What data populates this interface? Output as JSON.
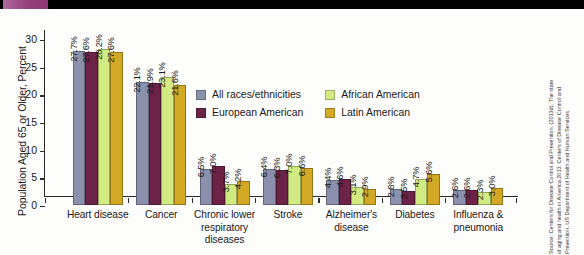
{
  "figure": {
    "y_axis_title": "Population Aged 65 or Older, Percent",
    "source_lines": [
      "Source: Centers for Disease Control and Prevention. (2013d). The state",
      "of aging and health in America 2013. Centers of Disease Control and",
      "Prevention, US Department of Health and Human Services."
    ]
  },
  "chart_data": {
    "type": "bar",
    "title": "",
    "xlabel": "",
    "ylabel": "Population Aged 65 or Older, Percent",
    "ylim": [
      0,
      30
    ],
    "yticks": [
      0,
      5,
      10,
      15,
      20,
      25,
      30
    ],
    "ytick_labels": [
      "0",
      "5",
      "10",
      "15",
      "20",
      "25",
      "30"
    ],
    "grid": false,
    "legend_position": "center",
    "value_suffix": "%",
    "categories": [
      "Heart disease",
      "Cancer",
      "Chronic lower respiratory diseases",
      "Stroke",
      "Alzheimer's disease",
      "Diabetes",
      "Influenza & pneumonia"
    ],
    "category_lines": [
      [
        "Heart disease"
      ],
      [
        "Cancer"
      ],
      [
        "Chronic lower",
        "respiratory diseases"
      ],
      [
        "Stroke"
      ],
      [
        "Alzheimer's",
        "disease"
      ],
      [
        "Diabetes"
      ],
      [
        "Influenza &",
        "pneumonia"
      ]
    ],
    "series": [
      {
        "name": "All races/ethnicities",
        "color": "#8b90ac",
        "values": [
          27.7,
          22.1,
          6.5,
          6.4,
          4.4,
          2.8,
          2.6
        ],
        "labels": [
          "27.7%",
          "22.1%",
          "6.5%",
          "6.4%",
          "4.4%",
          "2.8%",
          "2.6%"
        ]
      },
      {
        "name": "European American",
        "color": "#6d2347",
        "values": [
          27.6,
          21.9,
          7.0,
          6.3,
          4.6,
          2.5,
          2.6
        ],
        "labels": [
          "27.6%",
          "21.9%",
          "7.0%",
          "6.3%",
          "4.6%",
          "2.5%",
          "2.6%"
        ]
      },
      {
        "name": "African American",
        "color": "#d2ea82",
        "values": [
          28.2,
          23.1,
          3.7,
          7.0,
          3.1,
          4.7,
          2.3
        ],
        "labels": [
          "28.2%",
          "23.1%",
          "3.7%",
          "7.0%",
          "3.1%",
          "4.7%",
          "2.3%"
        ]
      },
      {
        "name": "Latin American",
        "color": "#d3a824",
        "values": [
          27.6,
          21.6,
          4.2,
          6.6,
          2.9,
          5.6,
          3.0
        ],
        "labels": [
          "27.6%",
          "21.6%",
          "4.2%",
          "6.6%",
          "2.9%",
          "5.6%",
          "3.0%"
        ]
      }
    ]
  }
}
